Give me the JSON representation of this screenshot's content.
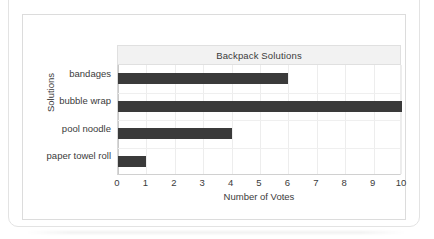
{
  "chart_data": {
    "type": "bar",
    "orientation": "horizontal",
    "title": "Backpack Solutions",
    "xlabel": "Number of Votes",
    "ylabel": "Solutions",
    "categories": [
      "bandages",
      "bubble wrap",
      "pool noodle",
      "paper towel roll"
    ],
    "values": [
      6,
      10,
      4,
      1
    ],
    "xlim": [
      0,
      10
    ],
    "xticks": [
      "0",
      "1",
      "2",
      "3",
      "4",
      "5",
      "6",
      "7",
      "8",
      "9",
      "10"
    ],
    "grid": true,
    "legend": "none",
    "bar_color": "#3a3a3a",
    "title_band_color": "#f2f2f2",
    "gridline_color": "#ededed",
    "text_color": "#3b3b3b"
  }
}
